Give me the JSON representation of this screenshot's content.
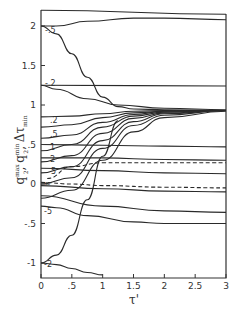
{
  "header": {
    "title_fragment": ""
  },
  "chart_data": {
    "type": "line",
    "title": "",
    "xlabel": "τ'",
    "ylabel": "q2^max, q2^min, Δτ_min",
    "xlim": [
      0,
      3
    ],
    "ylim": [
      -1.15,
      2.2
    ],
    "grid": false,
    "x_ticks": [
      "0",
      ".5",
      "1",
      "1.5",
      "2",
      "2.5",
      "3"
    ],
    "y_ticks": [
      "-1",
      "-.5",
      "0",
      ".5",
      "1",
      "1.5",
      "2"
    ],
    "curve_labels": [
      ".5",
      ".2",
      ".2",
      ".5",
      "1",
      "2",
      "5",
      "∞",
      "-5",
      "-2"
    ],
    "series": [
      {
        "name": "top boundary",
        "style": "solid",
        "x": [
          0,
          3
        ],
        "y": [
          2.2,
          2.15
        ]
      },
      {
        "name": "upper from 2",
        "style": "solid",
        "x": [
          0,
          0.25,
          0.75,
          1.5,
          2,
          3
        ],
        "y": [
          2.0,
          2.0,
          2.06,
          2.1,
          2.1,
          2.08
        ]
      },
      {
        "name": ".5 (from 2)",
        "style": "solid",
        "x": [
          0,
          0.25,
          0.5,
          0.75,
          1.0,
          1.25,
          1.5,
          2,
          3
        ],
        "y": [
          2.0,
          1.9,
          1.65,
          1.35,
          1.1,
          0.98,
          0.95,
          0.94,
          0.93
        ]
      },
      {
        "name": "level 1.25",
        "style": "solid",
        "x": [
          0,
          3
        ],
        "y": [
          1.25,
          1.24
        ]
      },
      {
        "name": "-.2 (from 1.25)",
        "style": "solid",
        "x": [
          0,
          0.25,
          0.75,
          1.25,
          2,
          3
        ],
        "y": [
          1.25,
          1.2,
          1.08,
          1.0,
          0.96,
          0.94
        ]
      },
      {
        "name": "q=0.85 lvl",
        "style": "solid",
        "x": [
          0,
          0.5,
          1.0,
          1.5,
          2,
          3
        ],
        "y": [
          0.85,
          0.86,
          0.89,
          0.92,
          0.93,
          0.93
        ]
      },
      {
        "name": ".2",
        "style": "solid",
        "x": [
          0,
          0.5,
          1.0,
          1.5,
          2,
          3
        ],
        "y": [
          0.72,
          0.75,
          0.84,
          0.9,
          0.92,
          0.93
        ]
      },
      {
        "name": ".5",
        "style": "solid",
        "x": [
          0,
          0.5,
          1.0,
          1.5,
          2,
          3
        ],
        "y": [
          0.58,
          0.62,
          0.78,
          0.88,
          0.92,
          0.93
        ]
      },
      {
        "name": "1",
        "style": "solid",
        "x": [
          0,
          0.5,
          1.0,
          1.5,
          2,
          3
        ],
        "y": [
          0.42,
          0.5,
          0.72,
          0.86,
          0.91,
          0.93
        ]
      },
      {
        "name": "2",
        "style": "solid",
        "x": [
          0,
          0.5,
          1.0,
          1.5,
          2,
          3
        ],
        "y": [
          0.28,
          0.36,
          0.64,
          0.83,
          0.9,
          0.93
        ]
      },
      {
        "name": "5",
        "style": "solid",
        "x": [
          0,
          0.5,
          1.0,
          1.5,
          2,
          3
        ],
        "y": [
          0.14,
          0.22,
          0.55,
          0.79,
          0.89,
          0.93
        ]
      },
      {
        "name": "∞",
        "style": "solid",
        "x": [
          0,
          0.5,
          1.0,
          1.5,
          2,
          3
        ],
        "y": [
          0.0,
          0.08,
          0.45,
          0.74,
          0.87,
          0.93
        ]
      },
      {
        "name": "-5",
        "style": "solid",
        "x": [
          0,
          0.5,
          1.0,
          1.5,
          2,
          3
        ],
        "y": [
          -0.18,
          -0.08,
          0.3,
          0.66,
          0.84,
          0.92
        ]
      },
      {
        "name": "steep from -1",
        "style": "solid",
        "x": [
          0,
          0.25,
          0.5,
          0.75,
          1.0,
          1.25
        ],
        "y": [
          -1.0,
          -0.9,
          -0.65,
          -0.2,
          0.35,
          0.8
        ]
      },
      {
        "name": "flat 0.5 lvl",
        "style": "solid",
        "x": [
          0,
          1.0,
          2.0,
          3.0
        ],
        "y": [
          0.5,
          0.49,
          0.48,
          0.47
        ]
      },
      {
        "name": "flat 0.33 lvl",
        "style": "solid",
        "x": [
          0,
          1.0,
          2.0,
          3.0
        ],
        "y": [
          0.33,
          0.33,
          0.31,
          0.3
        ]
      },
      {
        "name": "flat 0.18 lvl",
        "style": "solid",
        "x": [
          0,
          1.0,
          2.0,
          3.0
        ],
        "y": [
          0.2,
          0.17,
          0.14,
          0.13
        ]
      },
      {
        "name": "flat -0.05 lvl",
        "style": "solid",
        "x": [
          0,
          1.0,
          2.0,
          3.0
        ],
        "y": [
          -0.02,
          -0.06,
          -0.09,
          -0.1
        ]
      },
      {
        "name": "flat -0.3 lvl",
        "style": "solid",
        "x": [
          0,
          1.0,
          2.0,
          3.0
        ],
        "y": [
          -0.15,
          -0.28,
          -0.34,
          -0.36
        ]
      },
      {
        "name": "dashed upper",
        "style": "dashed",
        "x": [
          0.1,
          0.5,
          1.0,
          2.0,
          3.0
        ],
        "y": [
          0.07,
          0.22,
          0.27,
          0.27,
          0.27
        ]
      },
      {
        "name": "dashed lower",
        "style": "dashed",
        "x": [
          0,
          0.5,
          1.0,
          2.0,
          3.0
        ],
        "y": [
          0.02,
          0.0,
          -0.02,
          -0.04,
          -0.05
        ]
      },
      {
        "name": "-5 (lower)",
        "style": "solid",
        "x": [
          0,
          0.25,
          0.75,
          1.5,
          2,
          3
        ],
        "y": [
          -0.28,
          -0.3,
          -0.4,
          -0.48,
          -0.5,
          -0.5
        ]
      },
      {
        "name": "-2",
        "style": "solid",
        "x": [
          0,
          0.25,
          0.5,
          0.75,
          1.0
        ],
        "y": [
          -1.0,
          -1.02,
          -1.07,
          -1.12,
          -1.15
        ]
      }
    ]
  }
}
